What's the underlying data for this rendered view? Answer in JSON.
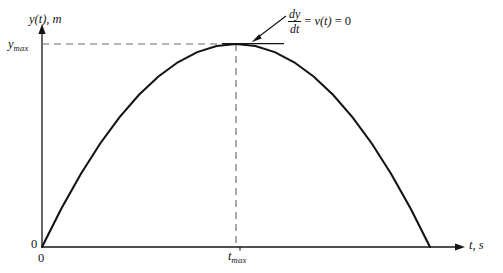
{
  "figure": {
    "type": "projectile-height-vs-time",
    "axes": {
      "y_title": "y(t), m",
      "x_title": "t, s",
      "y_max_tick": "y",
      "y_max_tick_sub": "max",
      "x_max_tick": "t",
      "x_max_tick_sub": "max",
      "origin_y_label": "0",
      "origin_x_label": "0"
    },
    "annotation": {
      "numerator": "dy",
      "denominator": "dt",
      "equals_1": "=",
      "velocity": "v(t)",
      "equals_2": "=",
      "value": "0"
    },
    "colors": {
      "curve": "#141414",
      "axis": "#141414",
      "dashed": "#6b6b6b",
      "background": "#ffffff"
    }
  },
  "chart_data": {
    "type": "line",
    "title": "",
    "xlabel": "t, s",
    "ylabel": "y(t), m",
    "grid": false,
    "legend": null,
    "xlim": [
      0,
      1.15
    ],
    "ylim": [
      0,
      1.12
    ],
    "xticks": [
      0,
      0.5
    ],
    "xticklabels": [
      "0",
      "t_max"
    ],
    "yticks": [
      0,
      1
    ],
    "yticklabels": [
      "0",
      "y_max"
    ],
    "series": [
      {
        "name": "y(t)",
        "description": "parabolic trajectory, apex at (t_max, y_max)",
        "x": [
          0.0,
          0.05,
          0.1,
          0.15,
          0.2,
          0.25,
          0.3,
          0.35,
          0.4,
          0.45,
          0.5,
          0.55,
          0.6,
          0.65,
          0.7,
          0.75,
          0.8,
          0.85,
          0.9,
          0.95,
          1.0
        ],
        "y": [
          0.0,
          0.19,
          0.36,
          0.51,
          0.64,
          0.75,
          0.84,
          0.91,
          0.96,
          0.99,
          1.0,
          0.99,
          0.96,
          0.91,
          0.84,
          0.75,
          0.64,
          0.51,
          0.36,
          0.19,
          0.0
        ]
      }
    ],
    "annotations": [
      {
        "text": "dy/dt = v(t) = 0",
        "points_to": "apex",
        "at_x": 0.5,
        "at_y": 1.0
      }
    ],
    "guides": [
      {
        "kind": "dashed-horizontal",
        "y": 1.0,
        "from_x": 0.0,
        "to_x": 0.5
      },
      {
        "kind": "dashed-vertical",
        "x": 0.5,
        "from_y": 0.0,
        "to_y": 1.0
      },
      {
        "kind": "tangent",
        "at_x": 0.5,
        "slope": 0
      }
    ]
  }
}
